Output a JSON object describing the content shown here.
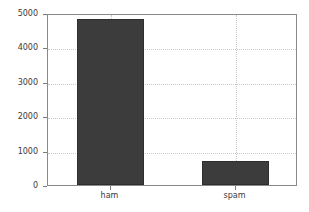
{
  "chart_data": {
    "type": "bar",
    "title": "",
    "xlabel": "",
    "ylabel": "",
    "categories": [
      "ham",
      "spam"
    ],
    "values": [
      4825,
      710
    ],
    "series": [
      {
        "name": "count",
        "values": [
          4825,
          710
        ]
      }
    ],
    "ylim": [
      0,
      5000
    ],
    "yticks": [
      0,
      1000,
      2000,
      3000,
      4000,
      5000
    ],
    "ytick_labels": [
      "0",
      "1000",
      "2000",
      "3000",
      "4000",
      "5000"
    ],
    "xtick_labels": [
      "ham",
      "spam"
    ],
    "grid": true,
    "grid_style": "dotted",
    "legend": null,
    "legend_position": "none",
    "colors": {
      "bar_fill": "#3c3c3c",
      "bar_edge": "#2e2e2e",
      "grid": "#c8c8c8",
      "axis": "#8a8a8a",
      "text": "#3a3a3a",
      "background": "#ffffff"
    }
  }
}
